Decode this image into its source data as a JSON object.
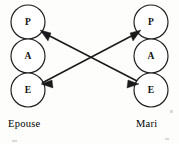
{
  "figure": {
    "type": "transactional-analysis-crossed-transaction",
    "background_color": "#fdfdfc",
    "stroke_color": "#1a1a1a",
    "width": 179,
    "height": 144
  },
  "columns": [
    {
      "id": "left",
      "party_label": "Epouse",
      "center_x": 28,
      "label_x": 8,
      "label_y": 118,
      "ego_states": [
        {
          "letter": "P",
          "name": "Parent",
          "cx": 28,
          "cy": 22,
          "r": 17
        },
        {
          "letter": "A",
          "name": "Adulte",
          "cx": 28,
          "cy": 56,
          "r": 17
        },
        {
          "letter": "E",
          "name": "Enfant",
          "cx": 28,
          "cy": 90,
          "r": 17
        }
      ]
    },
    {
      "id": "right",
      "party_label": "Mari",
      "center_x": 151,
      "label_x": 136,
      "label_y": 118,
      "ego_states": [
        {
          "letter": "P",
          "name": "Parent",
          "cx": 151,
          "cy": 22,
          "r": 17
        },
        {
          "letter": "A",
          "name": "Adulte",
          "cx": 151,
          "cy": 56,
          "r": 17
        },
        {
          "letter": "E",
          "name": "Enfant",
          "cx": 151,
          "cy": 90,
          "r": 17
        }
      ]
    }
  ],
  "transactions": [
    {
      "id": "mari-enfant-to-epouse-parent",
      "from": "right-E",
      "to": "left-P",
      "from_point": {
        "x": 137,
        "y": 81
      },
      "to_point": {
        "x": 41,
        "y": 31
      },
      "arrow_at": "to"
    },
    {
      "id": "epouse-enfant-to-mari-parent",
      "from": "left-E",
      "to": "right-P",
      "from_point": {
        "x": 41,
        "y": 83
      },
      "to_point": {
        "x": 140,
        "y": 31
      },
      "arrow_at": "to"
    },
    {
      "id": "epouse-parent-to-mari-enfant-return",
      "from": "left-P",
      "to": "right-E",
      "from_point": {
        "x": 41,
        "y": 31
      },
      "to_point": {
        "x": 137,
        "y": 81
      },
      "arrow_at": "none"
    }
  ],
  "arrow_heads": [
    {
      "id": "head-left-parent",
      "target": "left-P",
      "x": 41,
      "y": 31,
      "angle_deg": 208
    },
    {
      "id": "head-right-parent",
      "target": "right-P",
      "x": 140,
      "y": 31,
      "angle_deg": 332
    },
    {
      "id": "head-left-enfant",
      "target": "left-E",
      "x": 42,
      "y": 84,
      "angle_deg": 152
    },
    {
      "id": "head-right-enfant",
      "target": "right-E",
      "x": 138,
      "y": 84,
      "angle_deg": 28
    }
  ]
}
